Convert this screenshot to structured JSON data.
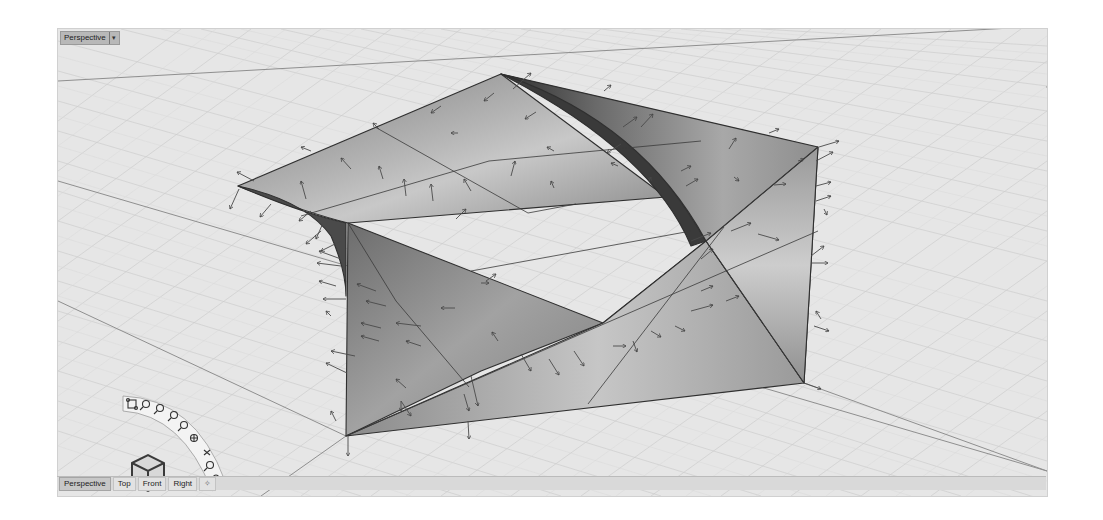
{
  "viewport": {
    "title": "Perspective",
    "title_dropdown_icon": "chevron-down-icon",
    "background_color": "#e4e4e4",
    "grid_minor_color": "#cfcfcf",
    "grid_major_color": "#9a9a9a",
    "surface_color": "#8c8c8c",
    "edge_color": "#2f2f2f"
  },
  "view_tabs": [
    {
      "label": "Perspective",
      "active": true
    },
    {
      "label": "Top",
      "active": false
    },
    {
      "label": "Front",
      "active": false
    },
    {
      "label": "Right",
      "active": false
    },
    {
      "label": "+",
      "icon": "add-viewport-icon",
      "active": false
    }
  ],
  "navigation_widget": {
    "tools": [
      {
        "name": "zoom-extents-icon"
      },
      {
        "name": "zoom-window-icon"
      },
      {
        "name": "zoom-selected-icon"
      },
      {
        "name": "rotate-view-icon"
      },
      {
        "name": "zoom-in-icon"
      },
      {
        "name": "target-icon"
      },
      {
        "name": "zoom-out-icon"
      },
      {
        "name": "zoom-dynamic-icon"
      },
      {
        "name": "pan-hand-icon"
      }
    ],
    "view_cube_icon": "view-cube-icon"
  },
  "compass_icon": "pushpin-compass-icon"
}
